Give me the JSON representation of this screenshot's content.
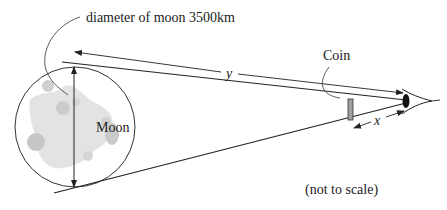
{
  "diagram": {
    "labels": {
      "diameter": "diameter of moon 3500km",
      "moon": "Moon",
      "coin": "Coin",
      "y": "y",
      "x": "x",
      "note": "(not to scale)"
    },
    "colors": {
      "line": "#222222",
      "moon_fill": "#e6e6e6",
      "moon_spots": "#c9c9c9",
      "eye": "#111111",
      "coin": "#999999"
    }
  }
}
